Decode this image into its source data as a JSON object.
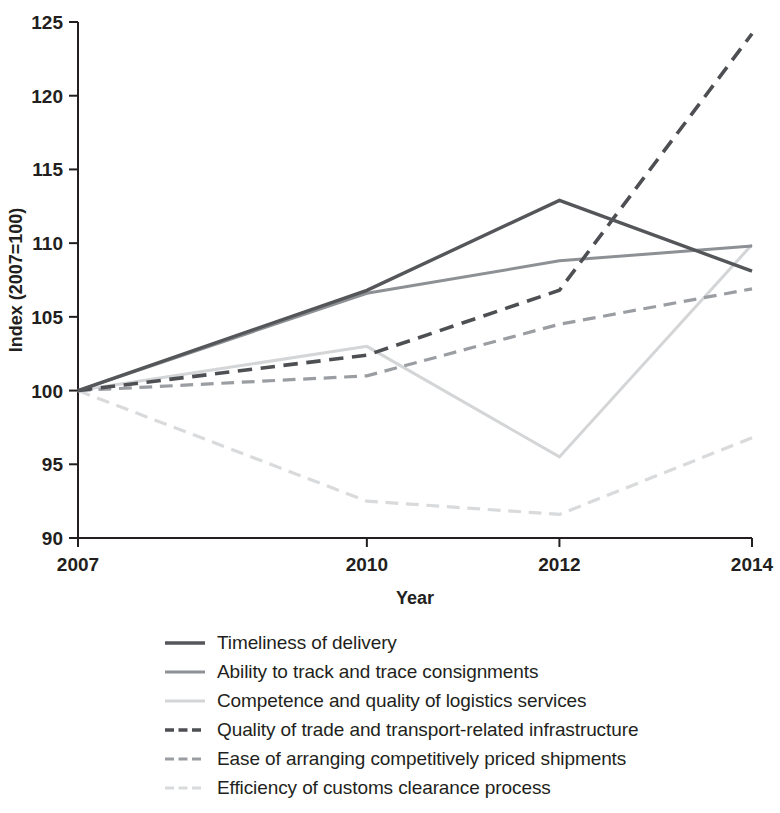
{
  "chart_data": {
    "type": "line",
    "title": "",
    "xlabel": "Year",
    "ylabel": "Index (2007=100)",
    "x": [
      2007,
      2010,
      2012,
      2014
    ],
    "xticklabels": [
      "2007",
      "2010",
      "2012",
      "2014"
    ],
    "yticks": [
      90,
      95,
      100,
      105,
      110,
      115,
      120,
      125
    ],
    "yticklabels": [
      "90",
      "95",
      "100",
      "105",
      "110",
      "115",
      "120",
      "125"
    ],
    "ylim": [
      90,
      125
    ],
    "xlim": [
      2007,
      2014
    ],
    "grid": false,
    "legend_position": "below",
    "series": [
      {
        "name": "Timeliness of delivery",
        "values": [
          100,
          106.8,
          112.9,
          108.1
        ],
        "color": "#54565a",
        "style": "solid",
        "width": 3.4
      },
      {
        "name": "Ability to track and trace consignments",
        "values": [
          100,
          106.6,
          108.8,
          109.8
        ],
        "color": "#8d9094",
        "style": "solid",
        "width": 3.0
      },
      {
        "name": "Competence and quality of logistics services",
        "values": [
          100,
          103.0,
          95.5,
          109.9
        ],
        "color": "#d3d5d7",
        "style": "solid",
        "width": 3.0
      },
      {
        "name": "Quality of trade and transport-related infrastructure",
        "values": [
          100,
          102.4,
          106.8,
          124.2
        ],
        "color": "#4d4f53",
        "style": "dashed",
        "width": 3.6
      },
      {
        "name": "Ease of arranging competitively priced shipments",
        "values": [
          100,
          101.0,
          104.5,
          106.9
        ],
        "color": "#9a9da1",
        "style": "dashed",
        "width": 3.2
      },
      {
        "name": "Efficiency of customs clearance process",
        "values": [
          100,
          92.5,
          91.6,
          96.8
        ],
        "color": "#d8dadc",
        "style": "dashed",
        "width": 3.2
      }
    ]
  },
  "legend": {
    "items": [
      {
        "label": "Timeliness of delivery"
      },
      {
        "label": "Ability to track and trace consignments"
      },
      {
        "label": "Competence and quality of logistics services"
      },
      {
        "label": "Quality of trade and transport-related infrastructure"
      },
      {
        "label": "Ease of arranging competitively priced shipments"
      },
      {
        "label": "Efficiency of customs clearance process"
      }
    ]
  }
}
